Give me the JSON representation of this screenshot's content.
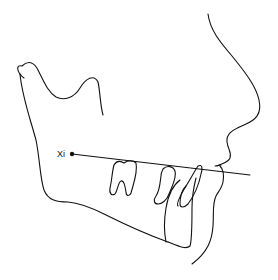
{
  "diagram": {
    "landmarks": [
      {
        "id": "xi",
        "label": "Xi"
      }
    ],
    "reference_line": {
      "name": "Xi point line through occlusal region"
    },
    "structures": [
      "soft-tissue profile",
      "mandible",
      "molar",
      "premolar",
      "incisor",
      "symphysis"
    ],
    "colors": {
      "line": "#111111",
      "background": "#ffffff"
    }
  }
}
